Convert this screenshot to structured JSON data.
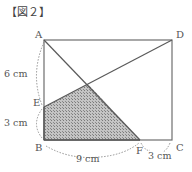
{
  "figure": {
    "title": "【図２】",
    "points": {
      "A": {
        "label": "A",
        "x": 44,
        "y": 40
      },
      "D": {
        "label": "D",
        "x": 172,
        "y": 40
      },
      "B": {
        "label": "B",
        "x": 44,
        "y": 140
      },
      "C": {
        "label": "C",
        "x": 172,
        "y": 140
      },
      "E": {
        "label": "E",
        "x": 44,
        "y": 107
      },
      "F": {
        "label": "F",
        "x": 140,
        "y": 140
      }
    },
    "measurements": {
      "AE": "6 cm",
      "EB": "3 cm",
      "BF": "9 cm",
      "FC": "3 cm"
    },
    "shaded_region": "EGFB",
    "colors": {
      "line": "#6e6e6e",
      "shade_fill": "#b8b8b8",
      "shade_dot": "#7a7a7a",
      "label": "#555555"
    }
  }
}
